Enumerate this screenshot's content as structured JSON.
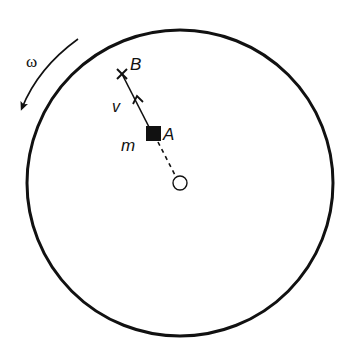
{
  "diagram": {
    "type": "physics-rotating-disk",
    "labels": {
      "omega": "ω",
      "point_b": "B",
      "point_a": "A",
      "velocity": "v",
      "mass": "m"
    },
    "elements": {
      "disk": {
        "cx": 180,
        "cy": 183,
        "r": 153
      },
      "center_axis": {
        "cx": 180,
        "cy": 183,
        "r": 7
      },
      "mass_block": {
        "x": 146,
        "y": 126,
        "size": 15
      },
      "point_b_marker": {
        "x": 122,
        "y": 74
      },
      "rotation_direction": "counterclockwise"
    },
    "colors": {
      "stroke": "#111111",
      "background": "#ffffff"
    }
  }
}
